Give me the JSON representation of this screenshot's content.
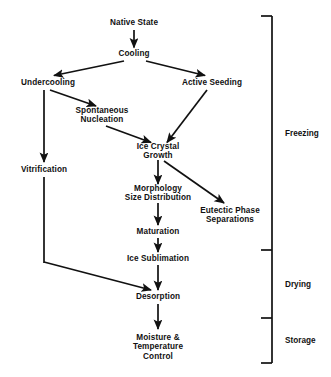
{
  "diagram": {
    "type": "flowchart",
    "background_color": "#ffffff",
    "line_color": "#111111",
    "text_color": "#111111",
    "nodes": [
      {
        "id": "native-state",
        "label": "Native State",
        "cx": 134,
        "cy": 23,
        "lines": 1
      },
      {
        "id": "cooling",
        "label": "Cooling",
        "cx": 134,
        "cy": 54,
        "lines": 1
      },
      {
        "id": "undercooling",
        "label": "Undercooling",
        "cx": 48,
        "cy": 83,
        "lines": 1
      },
      {
        "id": "active-seeding",
        "label": "Active Seeding",
        "cx": 212,
        "cy": 83,
        "lines": 1
      },
      {
        "id": "spontaneous-nucleation",
        "label": "Spontaneous\nNucleation",
        "cx": 102,
        "cy": 116,
        "lines": 2
      },
      {
        "id": "ice-crystal-growth",
        "label": "Ice Crystal\nGrowth",
        "cx": 158,
        "cy": 152,
        "lines": 2
      },
      {
        "id": "vitrification",
        "label": "Vitrification",
        "cx": 44,
        "cy": 170,
        "lines": 1
      },
      {
        "id": "morphology-size",
        "label": "Morphology\nSize Distribution",
        "cx": 158,
        "cy": 194,
        "lines": 2
      },
      {
        "id": "eutectic-phase",
        "label": "Eutectic Phase\nSeparations",
        "cx": 230,
        "cy": 216,
        "lines": 2
      },
      {
        "id": "maturation",
        "label": "Maturation",
        "cx": 158,
        "cy": 232,
        "lines": 1
      },
      {
        "id": "ice-sublimation",
        "label": "Ice Sublimation",
        "cx": 158,
        "cy": 259,
        "lines": 1
      },
      {
        "id": "desorption",
        "label": "Desorption",
        "cx": 158,
        "cy": 297,
        "lines": 1
      },
      {
        "id": "moisture-temp",
        "label": "Moisture &\nTemperature\nControl",
        "cx": 158,
        "cy": 343,
        "lines": 3
      }
    ],
    "edges": [
      {
        "id": "native-to-cooling",
        "from": "native-state",
        "to": "cooling"
      },
      {
        "id": "cooling-to-undercooling",
        "from": "cooling",
        "to": "undercooling"
      },
      {
        "id": "cooling-to-active-seeding",
        "from": "cooling",
        "to": "active-seeding"
      },
      {
        "id": "undercooling-to-spontaneous",
        "from": "undercooling",
        "to": "spontaneous-nucleation"
      },
      {
        "id": "undercooling-to-vitrification",
        "from": "undercooling",
        "to": "vitrification"
      },
      {
        "id": "spontaneous-to-ice-growth",
        "from": "spontaneous-nucleation",
        "to": "ice-crystal-growth"
      },
      {
        "id": "seeding-to-ice-growth",
        "from": "active-seeding",
        "to": "ice-crystal-growth"
      },
      {
        "id": "ice-growth-to-morphology",
        "from": "ice-crystal-growth",
        "to": "morphology-size"
      },
      {
        "id": "ice-growth-to-eutectic",
        "from": "ice-crystal-growth",
        "to": "eutectic-phase"
      },
      {
        "id": "morphology-to-maturation",
        "from": "morphology-size",
        "to": "maturation"
      },
      {
        "id": "maturation-to-sublimation",
        "from": "maturation",
        "to": "ice-sublimation"
      },
      {
        "id": "sublimation-to-desorption",
        "from": "ice-sublimation",
        "to": "desorption"
      },
      {
        "id": "vitrification-to-desorption",
        "from": "vitrification",
        "to": "desorption"
      },
      {
        "id": "desorption-to-moisture",
        "from": "desorption",
        "to": "moisture-temp"
      }
    ],
    "phases": [
      {
        "id": "freezing",
        "label": "Freezing",
        "top": 16,
        "bottom": 250,
        "label_y": 133
      },
      {
        "id": "drying",
        "label": "Drying",
        "top": 250,
        "bottom": 318,
        "label_y": 284
      },
      {
        "id": "storage",
        "label": "Storage",
        "top": 318,
        "bottom": 363,
        "label_y": 340
      }
    ],
    "bracket": {
      "x": 272,
      "tick_length": 11,
      "label_x": 285
    }
  }
}
